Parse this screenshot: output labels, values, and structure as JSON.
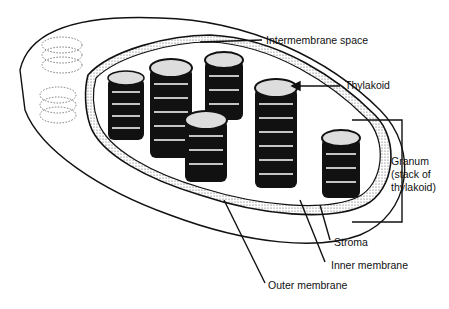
{
  "diagram": {
    "labels": {
      "intermembrane_space": "Intermembrane space",
      "thylakoid": "Thylakoid",
      "granum_line1": "Granum",
      "granum_line2": "(stack of",
      "granum_line3": "thylakoid)",
      "stroma": "Stroma",
      "inner_membrane": "Inner membrane",
      "outer_membrane": "Outer membrane"
    },
    "colors": {
      "ink": "#111111",
      "background": "#ffffff",
      "stipple": "#888888"
    }
  }
}
